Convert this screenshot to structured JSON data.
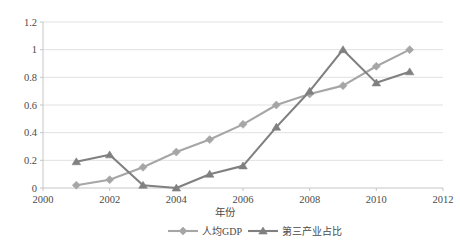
{
  "chart_data": {
    "type": "line",
    "title": "",
    "subtitle": "",
    "xlabel": "年份",
    "ylabel": "",
    "x": [
      2001,
      2002,
      2003,
      2004,
      2005,
      2006,
      2007,
      2008,
      2009,
      2010,
      2011
    ],
    "xlim": [
      2000,
      2012
    ],
    "ylim": [
      0,
      1.2
    ],
    "xticks": [
      "2000",
      "2002",
      "2004",
      "2006",
      "2008",
      "2010",
      "2012"
    ],
    "xtick_values": [
      2000,
      2002,
      2004,
      2006,
      2008,
      2010,
      2012
    ],
    "yticks": [
      "0",
      "0.2",
      "0.4",
      "0.6",
      "0.8",
      "1",
      "1.2"
    ],
    "ytick_values": [
      0,
      0.2,
      0.4,
      0.6,
      0.8,
      1,
      1.2
    ],
    "grid": "horizontal",
    "legend_position": "bottom",
    "series": [
      {
        "name": "人均GDP",
        "marker": "diamond",
        "color": "#a6a6a6",
        "values": [
          0.02,
          0.06,
          0.15,
          0.26,
          0.35,
          0.46,
          0.6,
          0.68,
          0.74,
          0.88,
          1.0
        ]
      },
      {
        "name": "第三产业占比",
        "marker": "triangle",
        "color": "#808080",
        "values": [
          0.19,
          0.24,
          0.02,
          0.0,
          0.1,
          0.16,
          0.44,
          0.7,
          1.0,
          0.76,
          0.84
        ]
      }
    ]
  },
  "colors": {
    "series1": "#a6a6a6",
    "series2": "#808080",
    "gridline": "#d9d9d9",
    "axis": "#bfbfbf",
    "text": "#4a4a4a",
    "background": "#ffffff"
  },
  "legend": {
    "items": [
      {
        "label": "人均GDP",
        "marker": "diamond-marker",
        "color": "#a6a6a6"
      },
      {
        "label": "第三产业占比",
        "marker": "triangle-marker",
        "color": "#808080"
      }
    ]
  },
  "axes": {
    "x_title": "年份"
  }
}
